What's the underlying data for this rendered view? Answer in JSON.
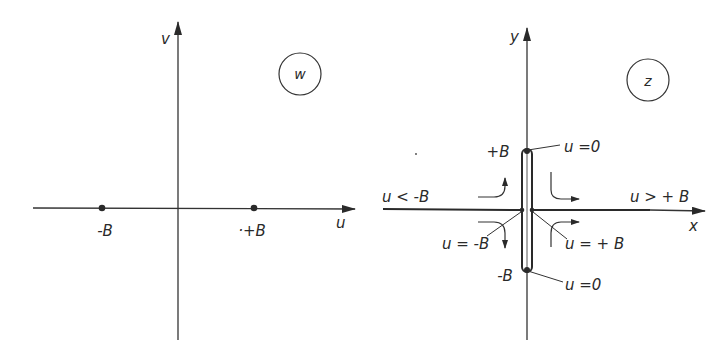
{
  "colors": {
    "ink": "#2a2a2a",
    "background": "#ffffff"
  },
  "w_plane": {
    "plane_label": "w",
    "horizontal_axis_label": "u",
    "vertical_axis_label": "v",
    "points": [
      {
        "label": "-B",
        "u": -1
      },
      {
        "label": "·+B",
        "u": 1
      }
    ]
  },
  "z_plane": {
    "plane_label": "z",
    "horizontal_axis_label": "x",
    "vertical_axis_label": "y",
    "slit": {
      "top_label": "+B",
      "bottom_label": "-B",
      "top_annotation": "u =0",
      "bottom_annotation": "u =0"
    },
    "region_labels": {
      "left": "u < -B",
      "right": "u > + B"
    },
    "point_annotations": {
      "left": "u = -B",
      "right": "u = + B"
    }
  }
}
